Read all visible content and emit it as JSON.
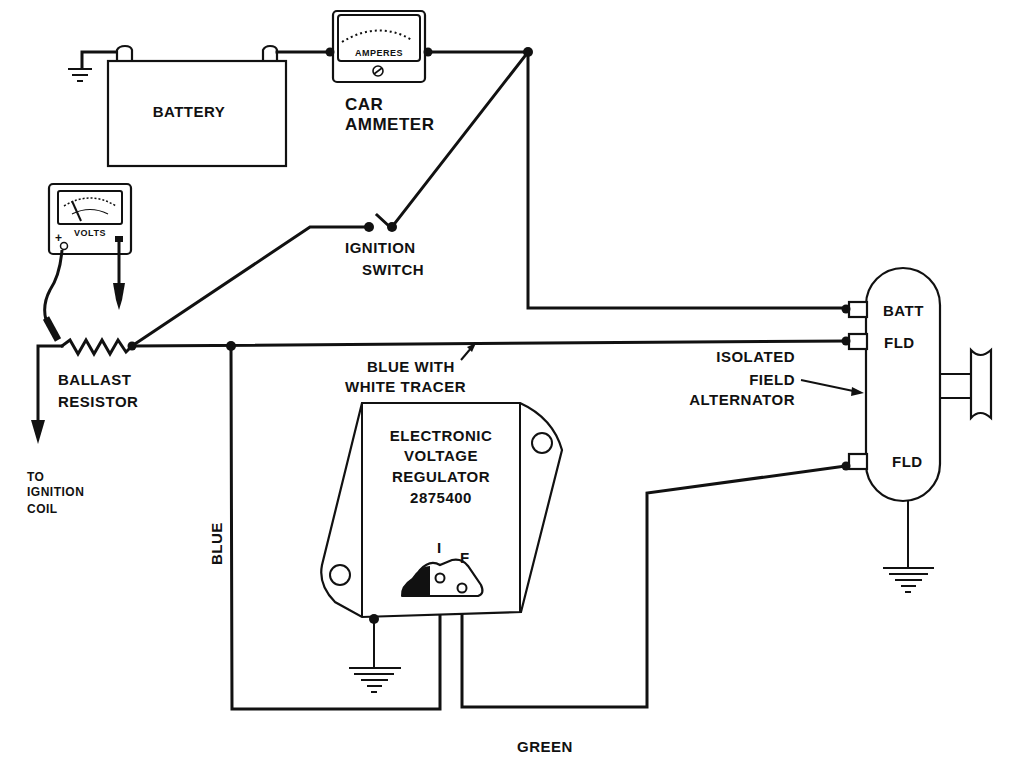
{
  "diagram": {
    "type": "wiring-schematic",
    "components": {
      "battery": {
        "label": "BATTERY"
      },
      "car_ammeter": {
        "dial_label": "AMPERES",
        "label_line1": "CAR",
        "label_line2": "AMMETER"
      },
      "voltmeter": {
        "dial_label": "VOLTS",
        "plus_terminal": "+",
        "minus_terminal": "−"
      },
      "ignition_switch": {
        "label_line1": "IGNITION",
        "label_line2": "SWITCH"
      },
      "ballast_resistor": {
        "label_line1": "BALLAST",
        "label_line2": "RESISTOR"
      },
      "ignition_coil_lead": {
        "label_line1": "TO",
        "label_line2": "IGNITION",
        "label_line3": "COIL"
      },
      "voltage_regulator": {
        "label_line1": "ELECTRONIC",
        "label_line2": "VOLTAGE",
        "label_line3": "REGULATOR",
        "part_number": "2875400",
        "terminal_i": "I",
        "terminal_f": "F"
      },
      "alternator": {
        "label_line1": "ISOLATED",
        "label_line2": "FIELD",
        "label_line3": "ALTERNATOR",
        "terminal_batt": "BATT",
        "terminal_fld_upper": "FLD",
        "terminal_fld_lower": "FLD"
      }
    },
    "wire_labels": {
      "blue_white_line1": "BLUE WITH",
      "blue_white_line2": "WHITE TRACER",
      "blue": "BLUE",
      "green": "GREEN"
    },
    "colors": {
      "ink": "#111111",
      "paper": "#ffffff"
    }
  }
}
